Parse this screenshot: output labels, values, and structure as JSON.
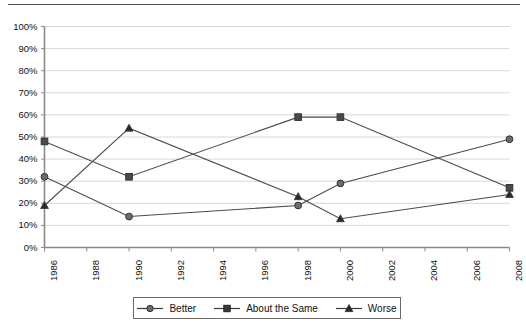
{
  "chart_data": {
    "type": "line",
    "title": "",
    "subtitle": "",
    "xlabel": "",
    "ylabel": "",
    "x": [
      1986,
      1990,
      1998,
      2000,
      2008
    ],
    "xlim": [
      1986,
      2008
    ],
    "ylim": [
      0,
      100
    ],
    "ytick_labels": [
      "0%",
      "10%",
      "20%",
      "30%",
      "40%",
      "50%",
      "60%",
      "70%",
      "80%",
      "90%",
      "100%"
    ],
    "ytick_values": [
      0,
      10,
      20,
      30,
      40,
      50,
      60,
      70,
      80,
      90,
      100
    ],
    "xtick_labels": [
      "1986",
      "1988",
      "1990",
      "1992",
      "1994",
      "1996",
      "1998",
      "2000",
      "2002",
      "2004",
      "2006",
      "2008"
    ],
    "xtick_values": [
      1986,
      1988,
      1990,
      1992,
      1994,
      1996,
      1998,
      2000,
      2002,
      2004,
      2006,
      2008
    ],
    "grid": "horizontal",
    "legend_position": "bottom",
    "series": [
      {
        "name": "Better",
        "marker": "circle",
        "color": "#6b6b6b",
        "line_color": "#4a4a4a",
        "values": [
          32,
          14,
          19,
          29,
          49
        ]
      },
      {
        "name": "About the Same",
        "marker": "square",
        "color": "#4a4a4a",
        "line_color": "#4a4a4a",
        "values": [
          48,
          32,
          59,
          59,
          27
        ]
      },
      {
        "name": "Worse",
        "marker": "triangle",
        "color": "#2b2b2b",
        "line_color": "#4a4a4a",
        "values": [
          19,
          54,
          23,
          13,
          24
        ]
      }
    ]
  },
  "legend": {
    "items": [
      {
        "label": "Better",
        "marker": "circle"
      },
      {
        "label": "About the Same",
        "marker": "square"
      },
      {
        "label": "Worse",
        "marker": "triangle"
      }
    ]
  },
  "colors": {
    "axis": "#8a8a8a",
    "grid": "#d8d8d8",
    "text": "#111111",
    "line": "#4a4a4a",
    "frame": "#6a6a6a"
  }
}
